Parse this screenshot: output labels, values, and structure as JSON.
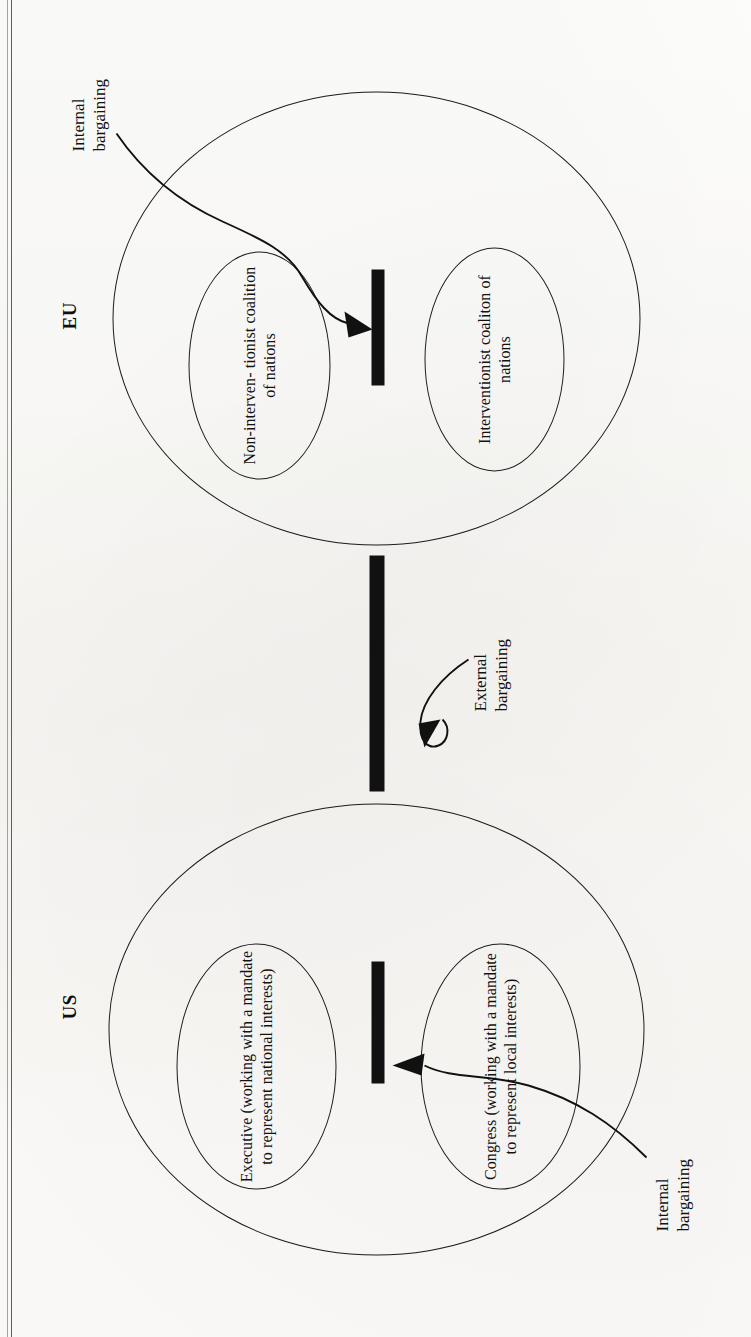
{
  "figure": {
    "orientation": "rotated-90-ccw",
    "groups": [
      {
        "id": "us",
        "name": "US",
        "actors": [
          {
            "id": "us-executive",
            "label": "Executive (working\nwith a mandate to\nrepresent national\ninterests)"
          },
          {
            "id": "us-congress",
            "label": "Congress (working\nwith a mandate to\nrepresent local\ninterests)"
          }
        ],
        "internal_link_label": "Internal\nbargaining"
      },
      {
        "id": "eu",
        "name": "EU",
        "actors": [
          {
            "id": "eu-non-interventionist",
            "label": "Non-interven-\ntionist coalition\nof nations"
          },
          {
            "id": "eu-interventionist",
            "label": "Interventionist\ncoaliton of\nnations"
          }
        ],
        "internal_link_label": "Internal\nbargaining"
      }
    ],
    "external_link_label": "External\nbargaining"
  },
  "colors": {
    "ink": "#111111",
    "outline": "#1c1c1c",
    "paper": "#fdfdfb"
  }
}
